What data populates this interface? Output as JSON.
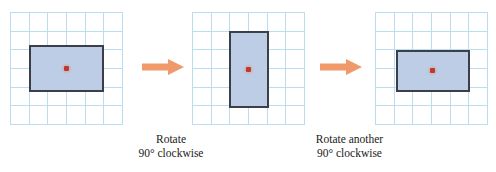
{
  "diagram": {
    "background_color": "#ffffff",
    "grid_line_color": "#bcdcf0",
    "rect_fill_color": "#bccde5",
    "rect_border_color": "#3a3f4a",
    "center_dot_color": "#c0392b",
    "arrow_color": "#f0996b",
    "text_color": "#1a1a1a"
  },
  "panels": [
    {
      "id": "panel-1",
      "label": "original-rectangle",
      "grid_columns": 6,
      "grid_rows": 6,
      "shape": "horizontal-rectangle",
      "orientation": "horizontal"
    },
    {
      "id": "panel-2",
      "label": "rotated-once-rectangle",
      "grid_columns": 6,
      "grid_rows": 6,
      "shape": "vertical-rectangle",
      "orientation": "vertical"
    },
    {
      "id": "panel-3",
      "label": "rotated-twice-rectangle",
      "grid_columns": 6,
      "grid_rows": 6,
      "shape": "horizontal-rectangle",
      "orientation": "horizontal"
    }
  ],
  "arrows": [
    {
      "id": "arrow-1",
      "name": "rotate-arrow-first",
      "direction": "right"
    },
    {
      "id": "arrow-2",
      "name": "rotate-arrow-second",
      "direction": "right"
    }
  ],
  "captions": [
    {
      "id": "caption-1",
      "line1": "Rotate",
      "line2": "90° clockwise"
    },
    {
      "id": "caption-2",
      "line1": "Rotate another",
      "line2": "90° clockwise"
    }
  ]
}
